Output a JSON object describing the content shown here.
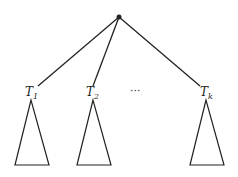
{
  "diagram": {
    "type": "tree",
    "root": {
      "x": 119,
      "y": 17
    },
    "subtrees": [
      {
        "label": "T",
        "subscript": "1",
        "label_x": 25,
        "label_y": 96,
        "edge_end": {
          "x": 38,
          "y": 86
        },
        "apex": {
          "x": 31,
          "y": 100
        },
        "base_left": 15,
        "base_right": 49,
        "base_y": 165
      },
      {
        "label": "T",
        "subscript": "2",
        "label_x": 86,
        "label_y": 96,
        "edge_end": {
          "x": 93,
          "y": 86
        },
        "apex": {
          "x": 93,
          "y": 100
        },
        "base_left": 77,
        "base_right": 111,
        "base_y": 165
      },
      {
        "label": "T",
        "subscript": "k",
        "label_x": 200,
        "label_y": 96,
        "edge_end": {
          "x": 200,
          "y": 86
        },
        "apex": {
          "x": 206,
          "y": 100
        },
        "base_left": 190,
        "base_right": 224,
        "base_y": 165
      }
    ],
    "ellipsis": {
      "text": "···",
      "x": 130,
      "y": 95
    },
    "colors": {
      "stroke": "#222222",
      "background": "#ffffff"
    }
  }
}
